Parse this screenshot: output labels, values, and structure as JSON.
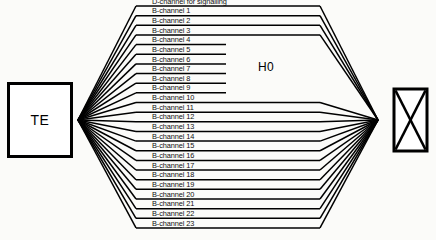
{
  "diagram": {
    "nodes": {
      "te": {
        "label": "TE",
        "name": "terminal-equipment-box"
      },
      "network": {
        "label": "",
        "name": "network-exchange-box",
        "symbol": "crossed-rectangle"
      }
    },
    "group_label": "H0",
    "channel_count": 24,
    "channels": [
      {
        "index": 0,
        "label": "D-channel for signalling",
        "type": "D",
        "in_h0_group": false
      },
      {
        "index": 1,
        "label": "B-channel 1",
        "type": "B",
        "in_h0_group": false
      },
      {
        "index": 2,
        "label": "B-channel 2",
        "type": "B",
        "in_h0_group": false
      },
      {
        "index": 3,
        "label": "B-channel 3",
        "type": "B",
        "in_h0_group": false
      },
      {
        "index": 4,
        "label": "B-channel 4",
        "type": "B",
        "in_h0_group": true
      },
      {
        "index": 5,
        "label": "B-channel 5",
        "type": "B",
        "in_h0_group": true
      },
      {
        "index": 6,
        "label": "B-channel 6",
        "type": "B",
        "in_h0_group": true
      },
      {
        "index": 7,
        "label": "B-channel 7",
        "type": "B",
        "in_h0_group": true
      },
      {
        "index": 8,
        "label": "B-channel 8",
        "type": "B",
        "in_h0_group": true
      },
      {
        "index": 9,
        "label": "B-channel 9",
        "type": "B",
        "in_h0_group": true
      },
      {
        "index": 10,
        "label": "B-channel 10",
        "type": "B",
        "in_h0_group": false
      },
      {
        "index": 11,
        "label": "B-channel 11",
        "type": "B",
        "in_h0_group": false
      },
      {
        "index": 12,
        "label": "B-channel 12",
        "type": "B",
        "in_h0_group": false
      },
      {
        "index": 13,
        "label": "B-channel 13",
        "type": "B",
        "in_h0_group": false
      },
      {
        "index": 14,
        "label": "B-channel 14",
        "type": "B",
        "in_h0_group": false
      },
      {
        "index": 15,
        "label": "B-channel 15",
        "type": "B",
        "in_h0_group": false
      },
      {
        "index": 16,
        "label": "B-channel 16",
        "type": "B",
        "in_h0_group": false
      },
      {
        "index": 17,
        "label": "B-channel 17",
        "type": "B",
        "in_h0_group": false
      },
      {
        "index": 18,
        "label": "B-channel 18",
        "type": "B",
        "in_h0_group": false
      },
      {
        "index": 19,
        "label": "B-channel 19",
        "type": "B",
        "in_h0_group": false
      },
      {
        "index": 20,
        "label": "B-channel 20",
        "type": "B",
        "in_h0_group": false
      },
      {
        "index": 21,
        "label": "B-channel 21",
        "type": "B",
        "in_h0_group": false
      },
      {
        "index": 22,
        "label": "B-channel 22",
        "type": "B",
        "in_h0_group": false
      },
      {
        "index": 23,
        "label": "B-channel 23",
        "type": "B",
        "in_h0_group": false
      }
    ],
    "colors": {
      "line": "#000000",
      "background": "#fbfbf9",
      "text": "#111111"
    },
    "geometry": {
      "left_hub_x": 78,
      "left_hub_y": 120,
      "right_hub_x": 378,
      "right_hub_y": 120,
      "rail_left_x": 136,
      "rail_right_x": 320,
      "h0_rail_right_x": 226,
      "first_row_y": 6,
      "row_spacing": 9.65
    }
  }
}
